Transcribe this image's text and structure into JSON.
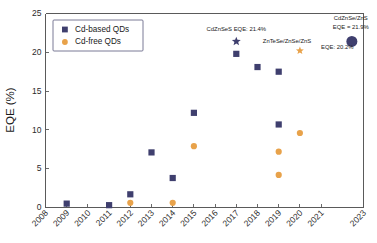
{
  "chart_data": {
    "type": "scatter",
    "title": "",
    "xlabel": "",
    "ylabel": "EQE (%)",
    "xlim": [
      2008,
      2023
    ],
    "ylim": [
      0,
      25
    ],
    "grid": false,
    "legend_position": "upper-left",
    "x_tick_labels": [
      "2008",
      "2009",
      "2010",
      "2011",
      "2012",
      "2013",
      "2014",
      "2015",
      "2016",
      "2017",
      "2018",
      "2019",
      "2020",
      "2021",
      "2023"
    ],
    "x_tick_values": [
      2008,
      2009,
      2010,
      2011,
      2012,
      2013,
      2014,
      2015,
      2016,
      2017,
      2018,
      2019,
      2020,
      2021,
      2023
    ],
    "y_tick_labels": [
      "0",
      "5",
      "10",
      "15",
      "20",
      "25"
    ],
    "y_tick_values": [
      0,
      5,
      10,
      15,
      20,
      25
    ],
    "series": [
      {
        "name": "Cd-based QDs",
        "marker": "square",
        "color": "#3f3f6e",
        "points": [
          {
            "x": 2009,
            "y": 0.5
          },
          {
            "x": 2011,
            "y": 0.3
          },
          {
            "x": 2012,
            "y": 1.7
          },
          {
            "x": 2013,
            "y": 7.1
          },
          {
            "x": 2014,
            "y": 3.8
          },
          {
            "x": 2015,
            "y": 12.2
          },
          {
            "x": 2017,
            "y": 19.8
          },
          {
            "x": 2018,
            "y": 18.1
          },
          {
            "x": 2019,
            "y": 17.5
          },
          {
            "x": 2019,
            "y": 10.7
          }
        ]
      },
      {
        "name": "Cd-free QDs",
        "marker": "circle",
        "color": "#e8a24a",
        "points": [
          {
            "x": 2012,
            "y": 0.6
          },
          {
            "x": 2014,
            "y": 0.6
          },
          {
            "x": 2015,
            "y": 7.9
          },
          {
            "x": 2019,
            "y": 7.2
          },
          {
            "x": 2019,
            "y": 4.2
          },
          {
            "x": 2020,
            "y": 9.6
          }
        ]
      }
    ],
    "highlight_markers": [
      {
        "name": "cdznses-star",
        "x": 2017,
        "y": 21.4,
        "marker": "star",
        "color": "#3f3f6e",
        "size": 9
      },
      {
        "name": "zntese-orange-star",
        "x": 2020,
        "y": 20.2,
        "marker": "star",
        "color": "#e8a24a",
        "size": 8
      },
      {
        "name": "cdznse-zns-circle",
        "x": 2022.45,
        "y": 21.4,
        "marker": "big-circle",
        "color": "#3f3f6e",
        "size": 11
      }
    ],
    "annotations": [
      {
        "name": "cdznses-eqe-annotation",
        "text": "CdZnSeS EQE: 21.4%",
        "x": 2017,
        "y": 22.8,
        "anchor": "middle"
      },
      {
        "name": "zntese-annotation",
        "text": "ZnTeSe/ZnSe/ZnS",
        "x": 2018.25,
        "y": 21.15,
        "anchor": "start"
      },
      {
        "name": "zntese-eqe-annotation",
        "text": "EQE: 20.2%",
        "x": 2021.0,
        "y": 20.45,
        "anchor": "start"
      },
      {
        "name": "cdznse-zns-name-annotation",
        "text": "CdZnSe/ZnS",
        "x": 2022.4,
        "y": 24.2,
        "anchor": "middle"
      },
      {
        "name": "cdznse-zns-eqe-annotation",
        "text": "EQE = 21.9%",
        "x": 2022.4,
        "y": 23.0,
        "anchor": "middle"
      }
    ],
    "legend": [
      {
        "label": "Cd-based QDs",
        "marker": "square",
        "color": "#3f3f6e"
      },
      {
        "label": "Cd-free QDs",
        "marker": "circle",
        "color": "#e8a24a"
      }
    ],
    "colors": {
      "cd_based": "#3f3f6e",
      "cd_free": "#e8a24a",
      "axis": "#5a5a5a",
      "text": "#1a1a1a",
      "background": "#ffffff"
    }
  }
}
